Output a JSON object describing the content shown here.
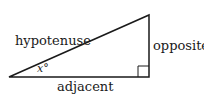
{
  "diagram": {
    "type": "right-triangle",
    "labels": {
      "hypotenuse": "hypotenuse",
      "opposite": "opposite",
      "adjacent": "adjacent",
      "angle": "x°"
    },
    "colors": {
      "stroke": "#1a1a1a",
      "background": "#ffffff"
    }
  }
}
